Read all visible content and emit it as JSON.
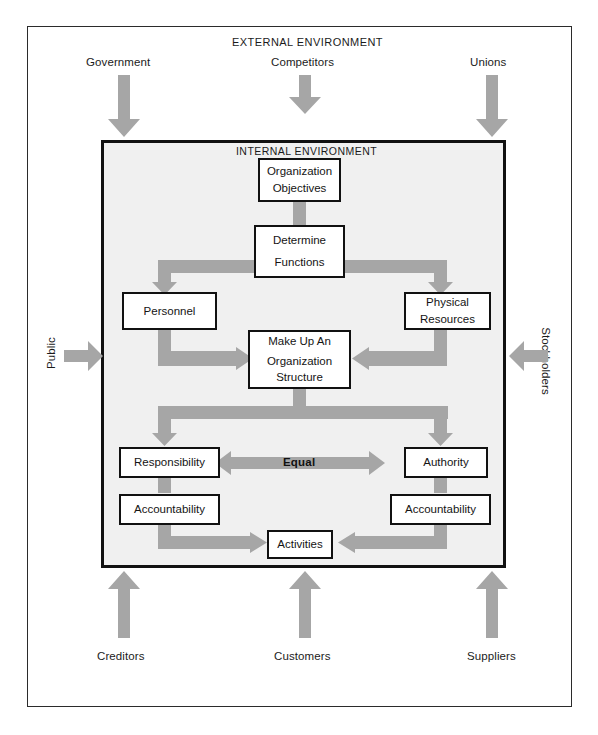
{
  "diagram": {
    "external_title": "EXTERNAL ENVIRONMENT",
    "internal_title": "INTERNAL ENVIRONMENT",
    "colors": {
      "arrow_gray": "#a6a6a6",
      "panel_fill": "#f0f0f0",
      "box_border": "#111111",
      "page_background": "#ffffff",
      "text": "#1b1b1b"
    }
  },
  "external_inputs": {
    "top": [
      {
        "label": "Government",
        "direction": "down"
      },
      {
        "label": "Competitors",
        "direction": "down"
      },
      {
        "label": "Unions",
        "direction": "down"
      }
    ],
    "left": [
      {
        "label": "Public",
        "direction": "right"
      }
    ],
    "right": [
      {
        "label": "Stockholders",
        "direction": "left"
      }
    ],
    "bottom": [
      {
        "label": "Creditors",
        "direction": "up"
      },
      {
        "label": "Customers",
        "direction": "up"
      },
      {
        "label": "Suppliers",
        "direction": "up"
      }
    ]
  },
  "nodes": {
    "organization_objectives": {
      "line1": "Organization",
      "line2": "Objectives"
    },
    "determine_functions": {
      "line1": "Determine",
      "line2": "Functions"
    },
    "personnel": {
      "line1": "Personnel"
    },
    "physical_resources": {
      "line1": "Physical",
      "line2": "Resources"
    },
    "organization_structure": {
      "line1": "Make Up An",
      "line2": "Organization",
      "line3": "Structure"
    },
    "responsibility": {
      "line1": "Responsibility"
    },
    "authority": {
      "line1": "Authority"
    },
    "accountability_left": {
      "line1": "Accountability"
    },
    "accountability_right": {
      "line1": "Accountability"
    },
    "activities": {
      "line1": "Activities"
    }
  },
  "connectors": {
    "equal_label": "Equal"
  }
}
